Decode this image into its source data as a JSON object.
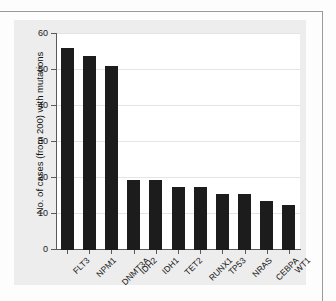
{
  "figure": {
    "background_color": "#ededed",
    "plot_background_color": "#ffffff",
    "bar_color": "#1c1c1c",
    "axis_color": "#5a5a5a",
    "gridline_color": "#e4e4e4"
  },
  "chart_data": {
    "type": "bar",
    "title": "",
    "subtitle": "",
    "xlabel": "",
    "ylabel": "No. of cases (from 200) with mutations",
    "categories": [
      "FLT3",
      "NPM1",
      "DNMT3A",
      "IDH2",
      "IDH1",
      "TET2",
      "RUNX1",
      "TP53",
      "NRAS",
      "CEBPA",
      "WT1"
    ],
    "values": [
      56,
      54,
      51,
      19.5,
      19.5,
      17.5,
      17.5,
      15.5,
      15.5,
      13.5,
      12.5
    ],
    "ylim": [
      0,
      60
    ],
    "yticks": [
      0,
      10,
      20,
      30,
      40,
      50,
      60
    ],
    "ytick_labels": [
      "0",
      "10",
      "20",
      "30",
      "40",
      "50",
      "60"
    ],
    "grid": "horizontal",
    "legend": "none",
    "xtick_label_rotation": -45,
    "annotations": []
  }
}
